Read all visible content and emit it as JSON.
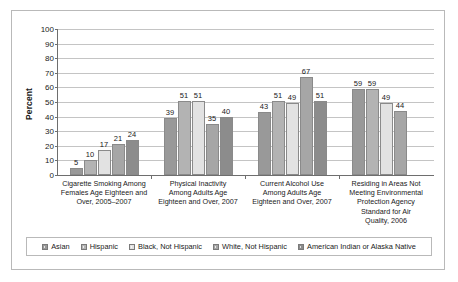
{
  "chart_data": {
    "type": "bar",
    "title": "",
    "xlabel": "",
    "ylabel": "Percent",
    "ylim": [
      0,
      100
    ],
    "ytick_step": 10,
    "yticks": [
      100,
      90,
      80,
      70,
      60,
      50,
      40,
      30,
      20,
      10,
      0
    ],
    "grid": true,
    "legend_position": "bottom",
    "categories": [
      "Cigarette Smoking Among Females Age Eighteen and Over, 2005–2007",
      "Physical Inactivity Among Adults Age Eighteen and Over, 2007",
      "Current Alcohol Use Among Adults Age Eighteen and Over, 2007",
      "Residing in Areas Not Meeting Environmental Protection Agency Standard for Air Quality, 2006"
    ],
    "category_lines": [
      [
        "Cigarette Smoking Among",
        "Females Age Eighteen and",
        "Over, 2005–2007"
      ],
      [
        "Physical Inactivity",
        "Among Adults Age",
        "Eighteen and Over, 2007"
      ],
      [
        "Current Alcohol Use",
        "Among Adults Age",
        "Eighteen and Over, 2007"
      ],
      [
        "Residing in Areas Not",
        "Meeting Environmental",
        "Protection Agency",
        "Standard for Air",
        "Quality, 2006"
      ]
    ],
    "series": [
      {
        "name": "Asian",
        "color": "#999999",
        "values": [
          5,
          39,
          43,
          59
        ]
      },
      {
        "name": "Hispanic",
        "color": "#b3b3b3",
        "values": [
          10,
          51,
          51,
          59
        ]
      },
      {
        "name": "Black, Not Hispanic",
        "color": "#e2e2e2",
        "values": [
          17,
          51,
          49,
          49
        ]
      },
      {
        "name": "White, Not Hispanic",
        "color": "#a6a6a6",
        "values": [
          21,
          35,
          67,
          44
        ]
      },
      {
        "name": "American Indian or Alaska Native",
        "color": "#8c8c8c",
        "values": [
          24,
          40,
          51,
          null
        ]
      }
    ]
  },
  "colors": {
    "frame": "#b9b9b9",
    "axis": "#6e6e6e",
    "gridline": "#c4c4c4",
    "text": "#1a1a1a",
    "background": "#ffffff"
  }
}
